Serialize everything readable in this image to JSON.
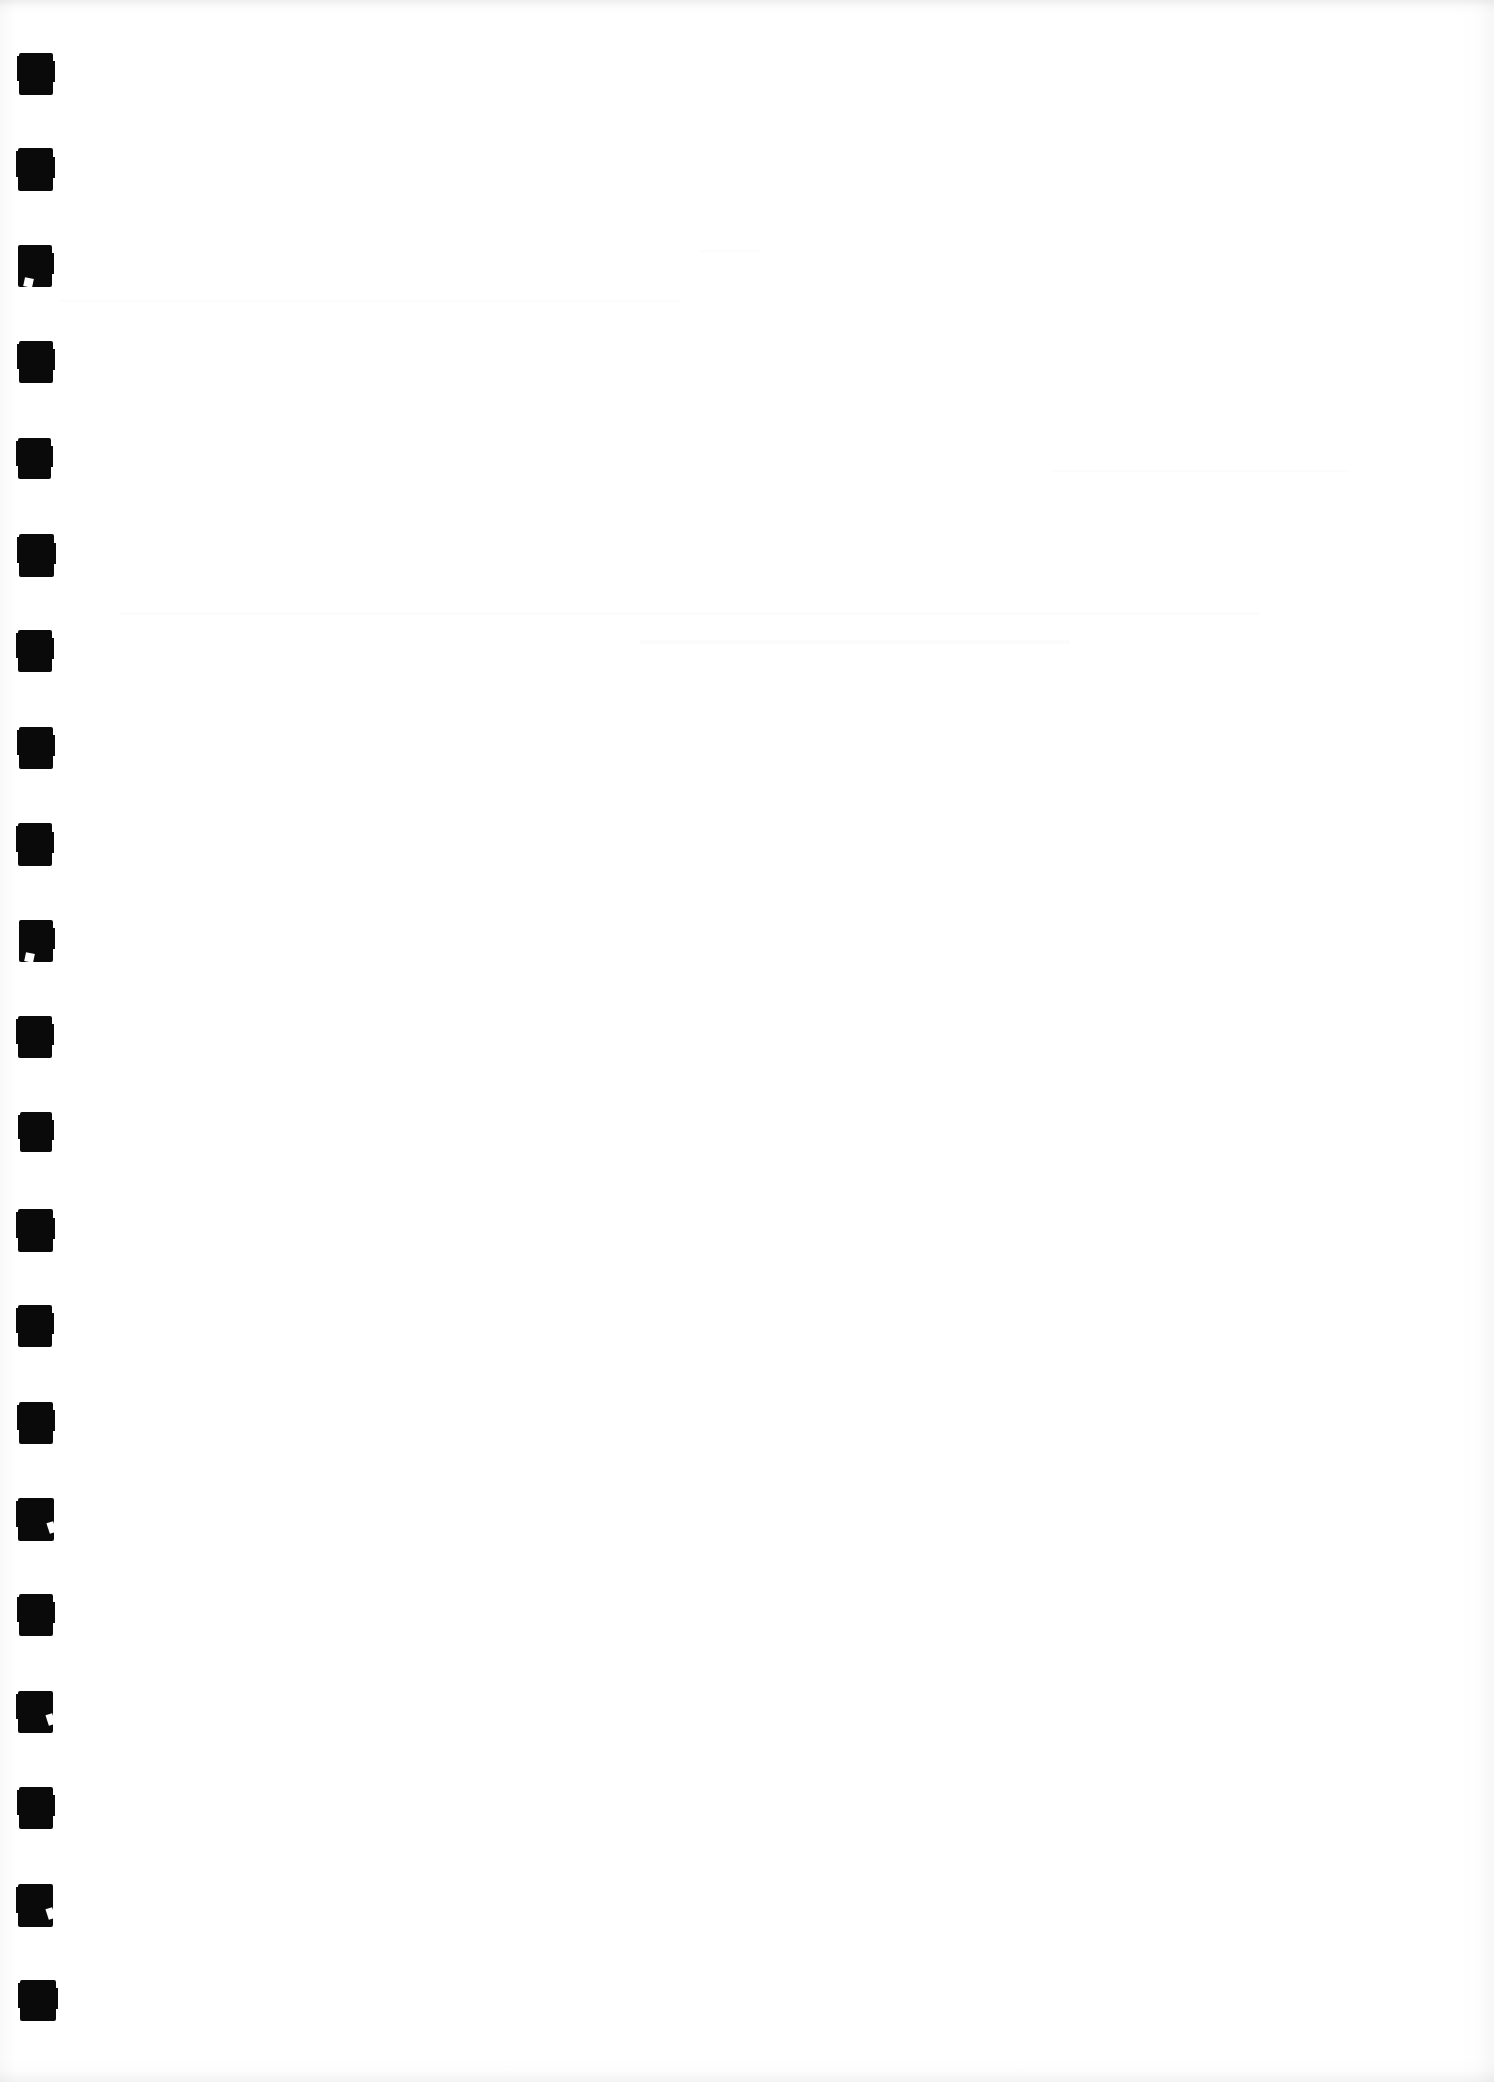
{
  "document": {
    "page_title": "Scanned Blank Page",
    "page_kind": "blank-scanned-page",
    "visible_text": "",
    "body_text": "",
    "notes": "No printed text, headings, figures, captions, page numbers or marginalia are rendered in the pixels. The page is blank apart from the left-edge register marks and faint scanner edge shading."
  },
  "colors": {
    "paper": "#ffffff",
    "mark_ink": "#0a0a0a",
    "edge_shadow": "#c8c8c8"
  },
  "register_marks": {
    "name": "scan-register-marks",
    "count": 21,
    "shape": "filled-rectangle",
    "color": "#0a0a0a",
    "left_px": 19,
    "width_px": 34,
    "height_px": 42,
    "first_top_px": 53,
    "spacing_px": 96.4,
    "marks": [
      {
        "index": 1,
        "top": 53,
        "left": 19,
        "width": 34,
        "height": 42,
        "defect": "none"
      },
      {
        "index": 2,
        "top": 148,
        "left": 18,
        "width": 35,
        "height": 43,
        "defect": "none"
      },
      {
        "index": 3,
        "top": 245,
        "left": 18,
        "width": 34,
        "height": 42,
        "defect": "notch-bl"
      },
      {
        "index": 4,
        "top": 341,
        "left": 19,
        "width": 34,
        "height": 42,
        "defect": "none"
      },
      {
        "index": 5,
        "top": 438,
        "left": 18,
        "width": 33,
        "height": 41,
        "defect": "none"
      },
      {
        "index": 6,
        "top": 534,
        "left": 19,
        "width": 35,
        "height": 43,
        "defect": "none"
      },
      {
        "index": 7,
        "top": 630,
        "left": 18,
        "width": 34,
        "height": 42,
        "defect": "none"
      },
      {
        "index": 8,
        "top": 727,
        "left": 19,
        "width": 34,
        "height": 42,
        "defect": "none"
      },
      {
        "index": 9,
        "top": 823,
        "left": 18,
        "width": 34,
        "height": 43,
        "defect": "none"
      },
      {
        "index": 10,
        "top": 920,
        "left": 19,
        "width": 34,
        "height": 42,
        "defect": "notch-bl"
      },
      {
        "index": 11,
        "top": 1016,
        "left": 18,
        "width": 34,
        "height": 42,
        "defect": "none"
      },
      {
        "index": 12,
        "top": 1112,
        "left": 20,
        "width": 32,
        "height": 40,
        "defect": "none"
      },
      {
        "index": 13,
        "top": 1209,
        "left": 18,
        "width": 35,
        "height": 43,
        "defect": "none"
      },
      {
        "index": 14,
        "top": 1305,
        "left": 18,
        "width": 34,
        "height": 42,
        "defect": "none"
      },
      {
        "index": 15,
        "top": 1402,
        "left": 19,
        "width": 34,
        "height": 42,
        "defect": "none"
      },
      {
        "index": 16,
        "top": 1498,
        "left": 18,
        "width": 36,
        "height": 43,
        "defect": "notch-br"
      },
      {
        "index": 17,
        "top": 1594,
        "left": 19,
        "width": 34,
        "height": 42,
        "defect": "none"
      },
      {
        "index": 18,
        "top": 1691,
        "left": 18,
        "width": 35,
        "height": 42,
        "defect": "notch-br"
      },
      {
        "index": 19,
        "top": 1787,
        "left": 19,
        "width": 34,
        "height": 42,
        "defect": "none"
      },
      {
        "index": 20,
        "top": 1884,
        "left": 18,
        "width": 35,
        "height": 43,
        "defect": "notch-br"
      },
      {
        "index": 21,
        "top": 1980,
        "left": 20,
        "width": 36,
        "height": 41,
        "defect": "none"
      }
    ]
  },
  "scan_artifacts": {
    "top_edge_shadow": true,
    "bottom_edge_shadow": true,
    "right_edge_shadow": true,
    "left_edge_shadow": true,
    "showthrough_ghosting": true
  }
}
